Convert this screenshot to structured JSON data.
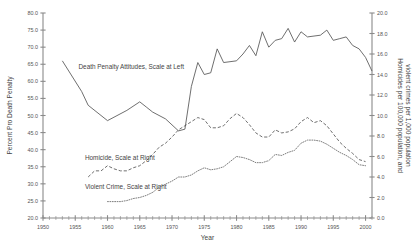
{
  "chart_data": {
    "type": "line",
    "title": "",
    "xlabel": "Year",
    "ylabel": "Percent Pro Death Penalty",
    "y2label": "Homicides per 100,000 population, and violent crimes per 1,000 population",
    "xlim": [
      1950,
      2001
    ],
    "ylim": [
      20.0,
      80.0
    ],
    "y2lim": [
      0.0,
      20.0
    ],
    "grid": false,
    "legend_position": "inline-annotations",
    "xticks": [
      1950,
      1955,
      1960,
      1965,
      1970,
      1975,
      1980,
      1985,
      1990,
      1995,
      2000
    ],
    "xtick_labels": [
      "1950",
      "1955",
      "1960",
      "1965",
      "1970",
      "1975",
      "1980",
      "1985",
      "1990",
      "1995",
      "2000"
    ],
    "xminor_step": 1,
    "yticks": [
      20.0,
      25.0,
      30.0,
      35.0,
      40.0,
      45.0,
      50.0,
      55.0,
      60.0,
      65.0,
      70.0,
      75.0,
      80.0
    ],
    "ytick_labels": [
      "20.0",
      "25.0",
      "30.0",
      "35.0",
      "40.0",
      "45.0",
      "50.0",
      "55.0",
      "60.0",
      "65.0",
      "70.0",
      "75.0",
      "80.0"
    ],
    "y2ticks": [
      0.0,
      2.0,
      4.0,
      6.0,
      8.0,
      10.0,
      12.0,
      14.0,
      16.0,
      18.0,
      20.0
    ],
    "y2tick_labels": [
      "0.0",
      "2.0",
      "4.0",
      "6.0",
      "8.0",
      "10.0",
      "12.0",
      "14.0",
      "16.0",
      "18.0",
      "20.0"
    ],
    "series": [
      {
        "name": "Death Penalty Attitudes, Scale at Left",
        "annotation": "Death Penalty Attitudes, Scale at Left",
        "axis": "left",
        "style": "solid",
        "color": "#555555",
        "x": [
          1953,
          1956,
          1957,
          1960,
          1963,
          1965,
          1966,
          1967,
          1969,
          1971,
          1972,
          1973,
          1974,
          1975,
          1976,
          1977,
          1978,
          1980,
          1981,
          1982,
          1983,
          1984,
          1985,
          1986,
          1987,
          1988,
          1989,
          1990,
          1991,
          1993,
          1994,
          1995,
          1996,
          1997,
          1998,
          1999,
          2000,
          2001
        ],
        "y": [
          66.0,
          57.0,
          53.0,
          48.5,
          51.5,
          54.0,
          52.5,
          51.0,
          49.0,
          45.5,
          46.0,
          58.5,
          65.5,
          62.0,
          62.5,
          69.5,
          65.5,
          66.0,
          68.0,
          70.5,
          67.5,
          74.5,
          70.0,
          72.0,
          72.5,
          75.5,
          71.5,
          74.5,
          73.0,
          73.5,
          75.0,
          72.0,
          72.5,
          73.0,
          70.5,
          69.5,
          67.0,
          63.0
        ]
      },
      {
        "name": "Homicide, Scale at Right",
        "annotation": "Homicide, Scale at Right",
        "axis": "right",
        "style": "dashed",
        "color": "#555555",
        "x": [
          1957,
          1958,
          1959,
          1960,
          1961,
          1962,
          1963,
          1964,
          1965,
          1966,
          1967,
          1968,
          1969,
          1970,
          1971,
          1972,
          1973,
          1974,
          1975,
          1976,
          1977,
          1978,
          1979,
          1980,
          1981,
          1982,
          1983,
          1984,
          1985,
          1986,
          1987,
          1988,
          1989,
          1990,
          1991,
          1992,
          1993,
          1994,
          1995,
          1996,
          1997,
          1998,
          1999,
          2000
        ],
        "y": [
          4.0,
          4.6,
          4.6,
          5.1,
          4.8,
          4.6,
          4.6,
          4.9,
          5.1,
          5.6,
          6.2,
          6.9,
          7.3,
          7.9,
          8.6,
          9.0,
          9.4,
          9.8,
          9.6,
          8.8,
          8.8,
          9.0,
          9.7,
          10.2,
          9.8,
          9.1,
          8.3,
          7.9,
          7.9,
          8.6,
          8.3,
          8.4,
          8.7,
          9.4,
          9.8,
          9.3,
          9.5,
          9.0,
          8.2,
          7.4,
          6.8,
          6.3,
          5.7,
          5.5
        ]
      },
      {
        "name": "Violent Crime, Scale at Right",
        "annotation": "Violent Crime, Scale at Right",
        "axis": "right",
        "style": "dotted",
        "color": "#666666",
        "x": [
          1960,
          1961,
          1962,
          1963,
          1964,
          1965,
          1966,
          1967,
          1968,
          1969,
          1970,
          1971,
          1972,
          1973,
          1974,
          1975,
          1976,
          1977,
          1978,
          1979,
          1980,
          1981,
          1982,
          1983,
          1984,
          1985,
          1986,
          1987,
          1988,
          1989,
          1990,
          1991,
          1992,
          1993,
          1994,
          1995,
          1996,
          1997,
          1998,
          1999,
          2000
        ],
        "y": [
          1.6,
          1.6,
          1.6,
          1.7,
          1.9,
          2.0,
          2.2,
          2.5,
          3.0,
          3.3,
          3.6,
          4.0,
          4.0,
          4.2,
          4.6,
          4.9,
          4.7,
          4.8,
          5.0,
          5.5,
          6.0,
          5.9,
          5.7,
          5.4,
          5.4,
          5.6,
          6.2,
          6.1,
          6.4,
          6.6,
          7.3,
          7.6,
          7.6,
          7.5,
          7.2,
          6.8,
          6.4,
          6.1,
          5.7,
          5.2,
          5.1
        ]
      }
    ],
    "annotations": [
      {
        "text": "Death Penalty Attitudes, Scale at Left",
        "x": 1955.5,
        "y": 63.5,
        "axis": "left"
      },
      {
        "text": "Homicide, Scale at Right",
        "x": 1956.5,
        "y": 37.0,
        "axis": "left"
      },
      {
        "text": "Violent Crime, Scale at Right",
        "x": 1956.5,
        "y": 28.5,
        "axis": "left"
      }
    ]
  }
}
